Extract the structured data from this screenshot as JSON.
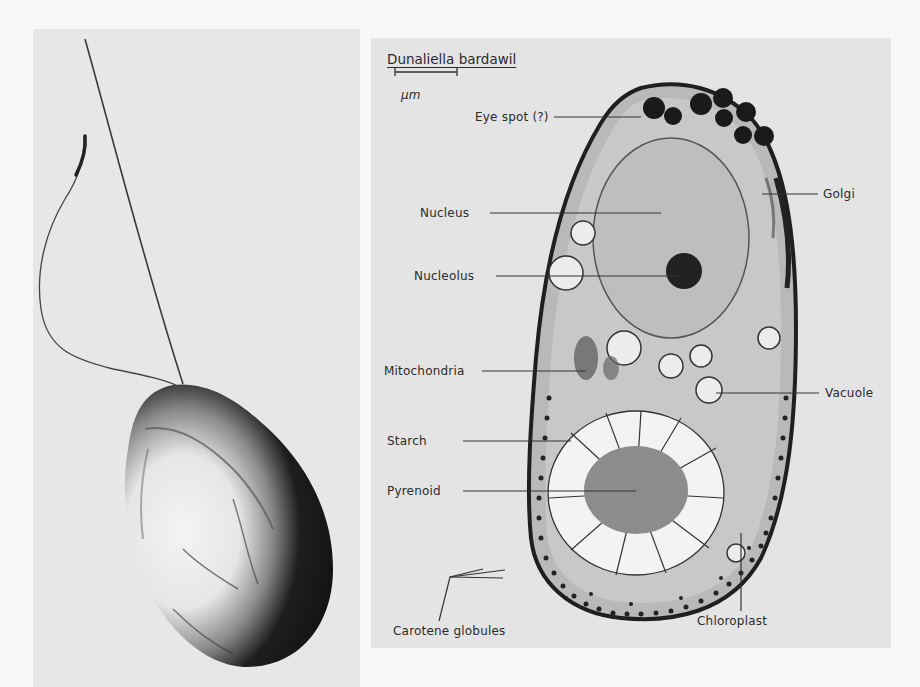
{
  "figure": {
    "left_panel": {
      "description": "Whole cell with two flagella (surface view)",
      "image_icon": "whole-cell-micrograph"
    },
    "right_panel": {
      "title": "Dunaliella bardawil",
      "scale_bar_label": "μm",
      "image_icon": "cell-section-micrograph",
      "labels": {
        "eye_spot": "Eye spot (?)",
        "golgi": "Golgi",
        "nucleus": "Nucleus",
        "nucleolus": "Nucleolus",
        "mitochondria": "Mitochondria",
        "vacuole": "Vacuole",
        "starch": "Starch",
        "pyrenoid": "Pyrenoid",
        "carotene_globules": "Carotene globules",
        "chloroplast": "Chloroplast"
      }
    },
    "colors": {
      "page_background": "#f8f8f8",
      "left_panel_background": "#e7e7e7",
      "right_panel_background": "#e4e4e4",
      "ink": "#2b2b2b"
    }
  }
}
